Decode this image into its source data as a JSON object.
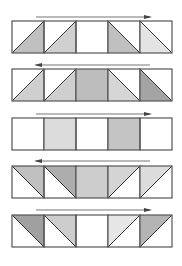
{
  "diagram": {
    "strip": {
      "left": 12,
      "cell_size": 32,
      "cells": 5
    },
    "colors": {
      "border": "#555555",
      "arrow": "#777777",
      "white": "#ffffff",
      "very_light": "#e6e6e6",
      "light": "#d2d2d2",
      "medium": "#bcbcbc",
      "dark": "#9a9a9a"
    },
    "rows": [
      {
        "arrow": {
          "direction": "right",
          "y": 17
        },
        "top": 21,
        "cells": [
          {
            "type": "tri",
            "diag": "bl-tr",
            "shade": "below",
            "fill": "#c0c0c0"
          },
          {
            "type": "tri",
            "diag": "bl-tr",
            "shade": "below",
            "fill": "#d0d0d0"
          },
          {
            "type": "empty",
            "fill": "#ffffff"
          },
          {
            "type": "tri",
            "diag": "tl-br",
            "shade": "below",
            "fill": "#c0c0c0"
          },
          {
            "type": "tri",
            "diag": "tl-br",
            "shade": "below",
            "fill": "#e4e4e4"
          }
        ]
      },
      {
        "arrow": {
          "direction": "left",
          "y": 65
        },
        "top": 69,
        "cells": [
          {
            "type": "tri",
            "diag": "bl-tr",
            "shade": "below",
            "fill": "#cfcfcf"
          },
          {
            "type": "tri",
            "diag": "bl-tr",
            "shade": "below",
            "fill": "#cfcfcf"
          },
          {
            "type": "full",
            "fill": "#bdbdbd"
          },
          {
            "type": "tri",
            "diag": "tl-br",
            "shade": "below",
            "fill": "#d6d6d6"
          },
          {
            "type": "tri",
            "diag": "tl-br",
            "shade": "below",
            "fill": "#a4a4a4"
          }
        ]
      },
      {
        "arrow": {
          "direction": "right",
          "y": 114
        },
        "top": 118,
        "cells": [
          {
            "type": "empty",
            "fill": "#ffffff"
          },
          {
            "type": "full",
            "fill": "#dcdcdc"
          },
          {
            "type": "empty",
            "fill": "#ffffff"
          },
          {
            "type": "full",
            "fill": "#c4c4c4"
          },
          {
            "type": "empty",
            "fill": "#ffffff"
          }
        ]
      },
      {
        "arrow": {
          "direction": "left",
          "y": 161
        },
        "top": 166,
        "cells": [
          {
            "type": "tri",
            "diag": "tl-br",
            "shade": "above",
            "fill": "#c0c0c0"
          },
          {
            "type": "tri",
            "diag": "tl-br",
            "shade": "above",
            "fill": "#adadad"
          },
          {
            "type": "full",
            "fill": "#cdcdcd"
          },
          {
            "type": "tri",
            "diag": "bl-tr",
            "shade": "above",
            "fill": "#d4d4d4"
          },
          {
            "type": "tri",
            "diag": "bl-tr",
            "shade": "above",
            "fill": "#dcdcdc"
          }
        ]
      },
      {
        "arrow": {
          "direction": "right",
          "y": 210
        },
        "top": 215,
        "cells": [
          {
            "type": "tri",
            "diag": "tl-br",
            "shade": "above",
            "fill": "#a0a0a0"
          },
          {
            "type": "tri",
            "diag": "tl-br",
            "shade": "above",
            "fill": "#cdcdcd"
          },
          {
            "type": "empty",
            "fill": "#ffffff"
          },
          {
            "type": "tri",
            "diag": "bl-tr",
            "shade": "above",
            "fill": "#e6e6e6"
          },
          {
            "type": "tri",
            "diag": "bl-tr",
            "shade": "above",
            "fill": "#b4b4b4"
          }
        ]
      }
    ],
    "arrow_span": {
      "x1": 36,
      "x2": 150
    }
  }
}
